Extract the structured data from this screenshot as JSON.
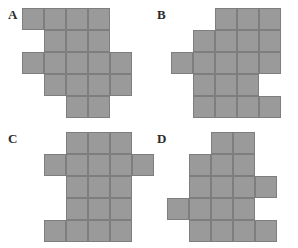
{
  "figure": {
    "background_color": "#ffffff",
    "cell_fill_color": "#9a9a9a",
    "cell_line_color": "#7e7e7e",
    "label_color": "#2b2b2b",
    "cell_size_px": 22
  },
  "panels": [
    {
      "id": "A",
      "label": "A",
      "label_pos": {
        "x": 8,
        "y": 8
      },
      "origin": {
        "x": 22,
        "y": 8
      },
      "cells": [
        [
          0,
          0
        ],
        [
          1,
          0
        ],
        [
          2,
          0
        ],
        [
          3,
          0
        ],
        [
          1,
          1
        ],
        [
          2,
          1
        ],
        [
          3,
          1
        ],
        [
          0,
          2
        ],
        [
          1,
          2
        ],
        [
          2,
          2
        ],
        [
          3,
          2
        ],
        [
          4,
          2
        ],
        [
          1,
          3
        ],
        [
          2,
          3
        ],
        [
          3,
          3
        ],
        [
          4,
          3
        ],
        [
          2,
          4
        ],
        [
          3,
          4
        ]
      ],
      "cell_count": 18
    },
    {
      "id": "B",
      "label": "B",
      "label_pos": {
        "x": 157,
        "y": 8
      },
      "origin": {
        "x": 171,
        "y": 8
      },
      "cells": [
        [
          2,
          0
        ],
        [
          3,
          0
        ],
        [
          4,
          0
        ],
        [
          1,
          1
        ],
        [
          2,
          1
        ],
        [
          3,
          1
        ],
        [
          4,
          1
        ],
        [
          0,
          2
        ],
        [
          1,
          2
        ],
        [
          2,
          2
        ],
        [
          3,
          2
        ],
        [
          4,
          2
        ],
        [
          1,
          3
        ],
        [
          2,
          3
        ],
        [
          3,
          3
        ],
        [
          1,
          4
        ],
        [
          2,
          4
        ],
        [
          3,
          4
        ],
        [
          4,
          4
        ]
      ],
      "cell_count": 19
    },
    {
      "id": "C",
      "label": "C",
      "label_pos": {
        "x": 8,
        "y": 132
      },
      "origin": {
        "x": 22,
        "y": 132
      },
      "cells": [
        [
          2,
          0
        ],
        [
          3,
          0
        ],
        [
          4,
          0
        ],
        [
          1,
          1
        ],
        [
          2,
          1
        ],
        [
          3,
          1
        ],
        [
          4,
          1
        ],
        [
          5,
          1
        ],
        [
          2,
          2
        ],
        [
          3,
          2
        ],
        [
          4,
          2
        ],
        [
          2,
          3
        ],
        [
          3,
          3
        ],
        [
          4,
          3
        ],
        [
          1,
          4
        ],
        [
          2,
          4
        ],
        [
          3,
          4
        ],
        [
          4,
          4
        ]
      ],
      "cell_count": 18
    },
    {
      "id": "D",
      "label": "D",
      "label_pos": {
        "x": 157,
        "y": 132
      },
      "origin": {
        "x": 167,
        "y": 132
      },
      "cells": [
        [
          2,
          0
        ],
        [
          3,
          0
        ],
        [
          1,
          1
        ],
        [
          2,
          1
        ],
        [
          3,
          1
        ],
        [
          1,
          2
        ],
        [
          2,
          2
        ],
        [
          3,
          2
        ],
        [
          4,
          2
        ],
        [
          0,
          3
        ],
        [
          1,
          3
        ],
        [
          2,
          3
        ],
        [
          3,
          3
        ],
        [
          1,
          4
        ],
        [
          2,
          4
        ],
        [
          3,
          4
        ],
        [
          4,
          4
        ]
      ],
      "cell_count": 17
    }
  ]
}
